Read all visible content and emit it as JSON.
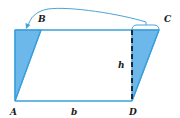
{
  "diagram": {
    "vertex_labels": {
      "A": "A",
      "B": "B",
      "C": "C",
      "D": "D"
    },
    "base_label": "b",
    "height_label": "h",
    "colors": {
      "outline": "#3aa0dc",
      "fill": "#6cb8ea",
      "arrow": "#4aa3d8",
      "dashed": "#1f2a36",
      "text": "#1a1a1a"
    }
  }
}
